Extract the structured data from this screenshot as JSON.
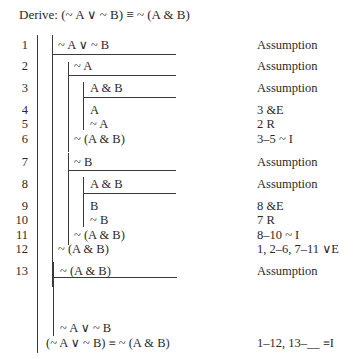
{
  "title": {
    "prefix": "Derive:",
    "goal": "(~ A ∨ ~ B) ≡ ~ (A & B)"
  },
  "lines": [
    {
      "num": "1",
      "formula": "~ A ∨ ~ B",
      "just": "Assumption"
    },
    {
      "num": "2",
      "formula": "~ A",
      "just": "Assumption"
    },
    {
      "num": "3",
      "formula": "A & B",
      "just": "Assumption"
    },
    {
      "num": "4",
      "formula": "A",
      "just": "3 &E"
    },
    {
      "num": "5",
      "formula": "~ A",
      "just": "2 R"
    },
    {
      "num": "6",
      "formula": "~ (A & B)",
      "just": "3–5 ~ I"
    },
    {
      "num": "7",
      "formula": "~ B",
      "just": "Assumption"
    },
    {
      "num": "8",
      "formula": "A & B",
      "just": "Assumption"
    },
    {
      "num": "9",
      "formula": "B",
      "just": "8 &E"
    },
    {
      "num": "10",
      "formula": "~ B",
      "just": "7 R"
    },
    {
      "num": "11",
      "formula": "~ (A & B)",
      "just": "8–10 ~ I"
    },
    {
      "num": "12",
      "formula": "~ (A & B)",
      "just": "1, 2–6, 7–11 ∨E"
    },
    {
      "num": "13",
      "formula": "~ (A & B)",
      "just": "Assumption"
    }
  ],
  "unnumbered": [
    {
      "formula": "~ A ∨ ~ B",
      "just": ""
    },
    {
      "formula": "(~ A ∨ ~ B) ≡ ~ (A & B)",
      "just": "1–12, 13–__ ≡I"
    }
  ]
}
